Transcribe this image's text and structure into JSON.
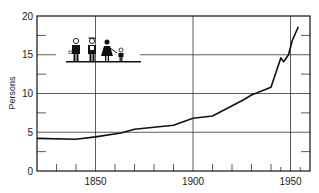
{
  "chart_data": {
    "type": "line",
    "title": "",
    "xlabel": "",
    "ylabel": "Persons",
    "xlim": [
      1820,
      1960
    ],
    "ylim": [
      0,
      20
    ],
    "grid": {
      "horizontal": [
        5,
        10,
        15
      ],
      "vertical": [
        1850,
        1900,
        1950
      ]
    },
    "x_tick_labels": [
      "1850",
      "1900",
      "1950"
    ],
    "x_minor_ticks": [
      1830,
      1840,
      1860,
      1870,
      1880,
      1890,
      1910,
      1920,
      1930,
      1940,
      1945,
      1955
    ],
    "y_tick_labels": [
      "0",
      "5",
      "10",
      "15",
      "20"
    ],
    "y_minor_ticks": [
      2.5,
      7.5,
      12.5,
      17.5
    ],
    "legend": null,
    "annotation": "pictogram of a family (man, farmer, woman, child)",
    "series": [
      {
        "name": "Persons",
        "x": [
          1820,
          1840,
          1850,
          1863,
          1870,
          1890,
          1900,
          1910,
          1926,
          1930,
          1940,
          1945,
          1946.5,
          1949,
          1951,
          1954
        ],
        "values": [
          4.2,
          4.1,
          4.4,
          4.9,
          5.4,
          5.9,
          6.8,
          7.1,
          9.2,
          9.8,
          10.8,
          14.6,
          14.1,
          15.0,
          16.9,
          18.6
        ]
      }
    ]
  }
}
